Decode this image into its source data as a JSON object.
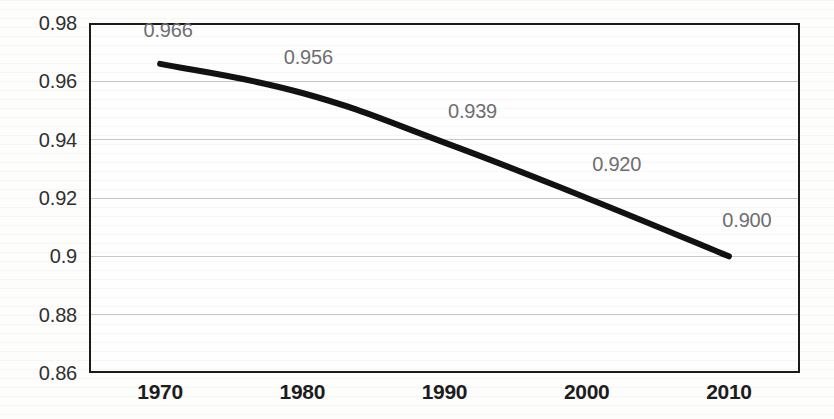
{
  "chart_data": {
    "type": "line",
    "title": "",
    "subtitle": "",
    "xlabel": "",
    "ylabel": "",
    "categories": [
      "1970",
      "1980",
      "1990",
      "2000",
      "2010"
    ],
    "x": [
      1970,
      1980,
      1990,
      2000,
      2010
    ],
    "values": [
      0.966,
      0.956,
      0.939,
      0.92,
      0.9
    ],
    "point_labels": [
      "0.966",
      "0.956",
      "0.939",
      "0.920",
      "0.900"
    ],
    "ylim": [
      0.86,
      0.98
    ],
    "yticks": [
      0.98,
      0.96,
      0.94,
      0.92,
      0.9,
      0.88,
      0.86
    ],
    "ytick_labels": [
      "0.98",
      "0.96",
      "0.94",
      "0.92",
      "0.9",
      "0.88",
      "0.86"
    ],
    "grid": true,
    "grid_axis": "y",
    "legend": false,
    "legend_position": "none",
    "series": [
      {
        "name": "",
        "values": [
          0.966,
          0.956,
          0.939,
          0.92,
          0.9
        ]
      }
    ],
    "colors": {
      "line": "#111111",
      "grid": "#c9c9c9",
      "frame": "#1a1a1a",
      "axis_text": "#2f2f2f",
      "xaxis_text": "#1c1c1c",
      "point_label_text": "#6e6e72",
      "plot_background": "#fefefe"
    },
    "line_width": 6,
    "smoothing": true,
    "markers": false
  },
  "axes": {
    "y": {
      "ticks": [
        {
          "label": "0.98",
          "value": 0.98
        },
        {
          "label": "0.96",
          "value": 0.96
        },
        {
          "label": "0.94",
          "value": 0.94
        },
        {
          "label": "0.92",
          "value": 0.92
        },
        {
          "label": "0.9",
          "value": 0.9
        },
        {
          "label": "0.88",
          "value": 0.88
        },
        {
          "label": "0.86",
          "value": 0.86
        }
      ]
    },
    "x": {
      "ticks": [
        {
          "label": "1970"
        },
        {
          "label": "1980"
        },
        {
          "label": "1990"
        },
        {
          "label": "2000"
        },
        {
          "label": "2010"
        }
      ]
    }
  },
  "data_labels": [
    {
      "text": "0.966"
    },
    {
      "text": "0.956"
    },
    {
      "text": "0.939"
    },
    {
      "text": "0.920"
    },
    {
      "text": "0.900"
    }
  ]
}
